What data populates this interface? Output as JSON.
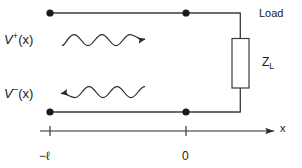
{
  "figure": {
    "type": "transmission-line-schematic",
    "title": "",
    "background_color": "#ffffff",
    "line_color": "#3a3a3a",
    "text_color": "#1a1a1a"
  },
  "labels": {
    "forward_wave": "V",
    "forward_wave_sign": "+",
    "forward_wave_arg": "(x)",
    "forward_wave_full": "V⁺(x)",
    "backward_wave": "V",
    "backward_wave_sign": "−",
    "backward_wave_arg": "(x)",
    "backward_wave_full": "V⁻(x)",
    "load": "Load",
    "impedance": "Z",
    "impedance_subscript": "L",
    "impedance_full": "Z_L",
    "axis_label": "x",
    "tick_left": "−ℓ",
    "tick_right": "0"
  },
  "geometry": {
    "top_conductor": {
      "x1": 50,
      "y": 13,
      "x2": 240
    },
    "bottom_conductor": {
      "x1": 50,
      "y": 112,
      "x2": 240
    },
    "right_riser_x": 240,
    "node_dots": [
      {
        "name": "top-left-terminal",
        "x": 50,
        "y": 13,
        "r": 3.6
      },
      {
        "name": "top-right-terminal",
        "x": 186,
        "y": 13,
        "r": 3.6
      },
      {
        "name": "bottom-left-terminal",
        "x": 50,
        "y": 112,
        "r": 3.6
      },
      {
        "name": "bottom-right-terminal",
        "x": 186,
        "y": 112,
        "r": 3.6
      }
    ],
    "load_box": {
      "x": 232,
      "y": 38,
      "width": 17,
      "height": 50
    },
    "axis": {
      "y": 131,
      "x1": 40,
      "x2": 276,
      "tick_left_x": 50,
      "tick_right_x": 186
    },
    "forward_arrow": {
      "x_start": 62,
      "x_end": 148,
      "y": 40,
      "direction": "right"
    },
    "backward_arrow": {
      "x_start": 144,
      "x_end": 58,
      "y": 92,
      "direction": "left"
    }
  }
}
